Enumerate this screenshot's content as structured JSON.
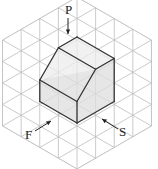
{
  "diagram": {
    "type": "isometric-grid-solid",
    "grid": {
      "cell": 21.5,
      "center": [
        77,
        83
      ],
      "rings": 4,
      "line_color": "#bdbdbd"
    },
    "solid": {
      "fill_top": "#ececec",
      "fill_side": "#dedede",
      "edge_color": "#333333",
      "vertices": {
        "top": [
          77,
          37
        ],
        "upper_left": [
          58.4,
          47.75
        ],
        "right_top": [
          114.2,
          58.5
        ],
        "inner": [
          95.6,
          69.25
        ],
        "left": [
          39.8,
          80
        ],
        "center": [
          77,
          101.5
        ],
        "right_bottom": [
          114.2,
          101.5
        ],
        "bottom": [
          77,
          123
        ],
        "left_bottom": [
          39.8,
          101.5
        ]
      }
    },
    "labels": [
      {
        "id": "P",
        "text": "P",
        "x": 65,
        "y": 3
      },
      {
        "id": "F",
        "text": "F",
        "x": 25,
        "y": 128
      },
      {
        "id": "S",
        "text": "S",
        "x": 119,
        "y": 125
      }
    ],
    "arrows": [
      {
        "id": "P",
        "from": [
          68,
          18
        ],
        "to": [
          68,
          34
        ]
      },
      {
        "id": "F",
        "from": [
          35,
          131
        ],
        "to": [
          51,
          121
        ]
      },
      {
        "id": "S",
        "from": [
          118,
          129
        ],
        "to": [
          102,
          119
        ]
      }
    ]
  }
}
